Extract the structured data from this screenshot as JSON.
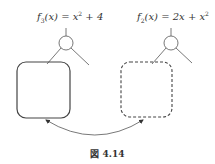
{
  "labels": {
    "left": {
      "fn": "f",
      "sub": "3",
      "arg": "(x) = x",
      "sup": "2",
      "rest": " + 4"
    },
    "right": {
      "fn": "f",
      "sub": "2",
      "arg": "(x) = 2x + x",
      "sup": "2",
      "rest": ""
    }
  },
  "caption": "図 4.14",
  "colors": {
    "stroke": "#555555",
    "text": "#333333"
  }
}
